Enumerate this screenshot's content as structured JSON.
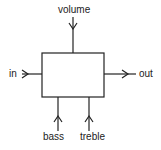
{
  "diagram": {
    "type": "block-diagram",
    "block": {
      "label": ""
    },
    "inputs": [
      {
        "id": "in",
        "label": "in",
        "side": "left"
      },
      {
        "id": "volume",
        "label": "volume",
        "side": "top"
      },
      {
        "id": "bass",
        "label": "bass",
        "side": "bottom"
      },
      {
        "id": "treble",
        "label": "treble",
        "side": "bottom"
      }
    ],
    "outputs": [
      {
        "id": "out",
        "label": "out",
        "side": "right"
      }
    ],
    "colors": {
      "stroke": "#222222",
      "background": "#ffffff"
    }
  }
}
